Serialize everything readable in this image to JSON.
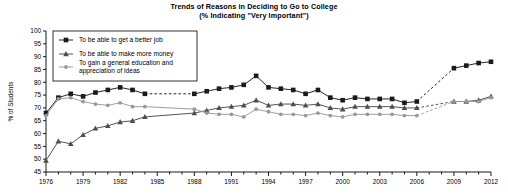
{
  "chart_data": {
    "type": "line",
    "title": "Trends of Reasons in Deciding to Go to College",
    "subtitle": "(% Indicating \"Very Important\")",
    "xlabel": "",
    "ylabel": "% of Students",
    "ylim": [
      45,
      100
    ],
    "ytick_labels": [
      "100",
      "95",
      "90",
      "85",
      "80",
      "75",
      "70",
      "65",
      "60",
      "55",
      "50",
      "45"
    ],
    "xlim": [
      1976,
      2012
    ],
    "xtick_labels": [
      "1976",
      "1979",
      "1982",
      "1985",
      "1988",
      "1991",
      "1994",
      "1997",
      "2000",
      "2003",
      "2006",
      "2009",
      "2012"
    ],
    "xtick_step": 3,
    "xminor_step": 1,
    "grid": false,
    "legend_position": "top-left",
    "legend_entries": [
      {
        "label": "To be able to get a better job",
        "marker": "square",
        "color": "#1a1a1a"
      },
      {
        "label": "To be able to make more money",
        "marker": "triangle",
        "color": "#4d4d4d"
      },
      {
        "label": "To gain a general education and appreciation of ideas",
        "marker": "circle",
        "color": "#999999"
      }
    ],
    "x": [
      1976,
      1977,
      1978,
      1979,
      1980,
      1981,
      1982,
      1983,
      1984,
      1988,
      1989,
      1990,
      1991,
      1992,
      1993,
      1994,
      1995,
      1996,
      1997,
      1998,
      1999,
      2000,
      2001,
      2002,
      2003,
      2004,
      2005,
      2006,
      2009,
      2010,
      2011,
      2012
    ],
    "series": [
      {
        "name": "To be able to get a better job",
        "marker": "square",
        "color": "#1a1a1a",
        "values": [
          68,
          74,
          75.5,
          74.5,
          76,
          77,
          78,
          77,
          75.5,
          75.5,
          76.5,
          77.5,
          78,
          79,
          82.5,
          78,
          77.5,
          77,
          75.5,
          77,
          74,
          73,
          74,
          73.5,
          73.5,
          73.5,
          72,
          72.5,
          85.5,
          86.5,
          87.5,
          88
        ],
        "gaps": [
          [
            1984,
            1988
          ],
          [
            2006,
            2009
          ]
        ]
      },
      {
        "name": "To be able to make more money",
        "marker": "triangle",
        "color": "#4d4d4d",
        "values": [
          49.5,
          57,
          56,
          59.5,
          62,
          63,
          64.5,
          65,
          66.5,
          68,
          69,
          70,
          70.5,
          71,
          73,
          71,
          71.5,
          71.5,
          71,
          71.5,
          70,
          69.5,
          70.5,
          70.5,
          70.5,
          70.5,
          70,
          70,
          72.5,
          72.5,
          73,
          74.5
        ],
        "gaps": [
          [
            2006,
            2009
          ]
        ]
      },
      {
        "name": "To gain a general education and appreciation of ideas",
        "marker": "circle",
        "color": "#999999",
        "values": [
          67,
          73.5,
          74,
          72.5,
          71.5,
          71,
          72,
          70.5,
          70.5,
          69.5,
          68,
          67.5,
          67.5,
          66.5,
          69.5,
          68.5,
          67.5,
          67.5,
          67,
          68,
          67,
          66.5,
          67.5,
          67.5,
          67.5,
          67.5,
          67,
          67,
          72.5,
          72.5,
          72.5,
          74
        ],
        "gaps": [
          [
            2006,
            2009
          ]
        ]
      }
    ]
  }
}
